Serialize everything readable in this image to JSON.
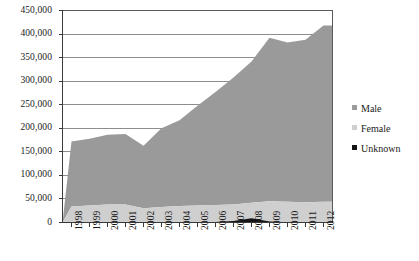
{
  "chart_data": {
    "type": "area",
    "stacked": true,
    "title": "",
    "subtitle": "",
    "xlabel": "",
    "ylabel": "",
    "grid": true,
    "legend_position": "right",
    "ylim": [
      0,
      450000
    ],
    "ytick_labels": [
      "450,000",
      "400,000",
      "350,000",
      "300,000",
      "250,000",
      "200,000",
      "150,000",
      "100,000",
      "50,000",
      "0"
    ],
    "ytick_values": [
      450000,
      400000,
      350000,
      300000,
      250000,
      200000,
      150000,
      100000,
      50000,
      0
    ],
    "categories": [
      "1998",
      "1999",
      "2000",
      "2001",
      "2002",
      "2003",
      "2004",
      "2005",
      "2006",
      "2007",
      "2008",
      "2009",
      "2010",
      "2011",
      "2012"
    ],
    "series": [
      {
        "name": "Female",
        "color": "#cfcfcf",
        "values": [
          34000,
          36000,
          38000,
          38000,
          30000,
          33000,
          35000,
          36000,
          37000,
          38000,
          42000,
          45000,
          44000,
          43000,
          44000
        ]
      },
      {
        "name": "Male",
        "color": "#9a9a9a",
        "values": [
          138000,
          142000,
          148000,
          150000,
          133000,
          167000,
          182000,
          212000,
          240000,
          270000,
          300000,
          347000,
          338000,
          345000,
          374000
        ]
      },
      {
        "name": "Unknown",
        "color": "#141414",
        "values": [
          0,
          0,
          0,
          0,
          0,
          0,
          0,
          0,
          1000,
          3000,
          9000,
          2000,
          500,
          0,
          0
        ]
      }
    ],
    "stacked_totals": [
      172000,
      178000,
      186000,
      188000,
      163000,
      200000,
      217000,
      248000,
      278000,
      311000,
      351000,
      394000,
      382500,
      388000,
      418000
    ],
    "origin_value": 0
  },
  "legend": {
    "items": [
      {
        "label": "Male",
        "color": "#9a9a9a"
      },
      {
        "label": "Female",
        "color": "#cfcfcf"
      },
      {
        "label": "Unknown",
        "color": "#141414"
      }
    ]
  }
}
